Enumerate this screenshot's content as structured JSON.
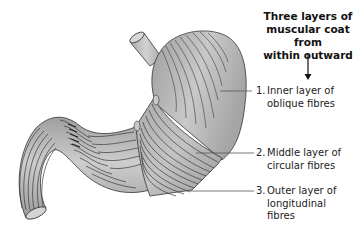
{
  "diagram": {
    "heading": {
      "line1": "Three layers of",
      "line2": "muscular coat from",
      "line3": "within outward"
    },
    "labels": [
      {
        "number": "1.",
        "line1": "Inner layer of",
        "line2": "oblique fibres",
        "line3": ""
      },
      {
        "number": "2.",
        "line1": "Middle layer of",
        "line2": "circular fibres",
        "line3": ""
      },
      {
        "number": "3.",
        "line1": "Outer layer of",
        "line2": "longitudinal",
        "line3": "fibres"
      }
    ],
    "colors": {
      "organ_fill": "#b3b3b3",
      "organ_light": "#d6d6d6",
      "fibre_line": "#3a3a3a",
      "leader_line": "#555555",
      "text": "#222222"
    }
  }
}
